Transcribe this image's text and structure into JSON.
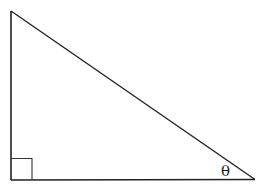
{
  "diagram": {
    "type": "right-triangle",
    "angle_label": "θ",
    "right_angle_marker": true,
    "stroke_color": "#222222",
    "background": "#ffffff"
  }
}
